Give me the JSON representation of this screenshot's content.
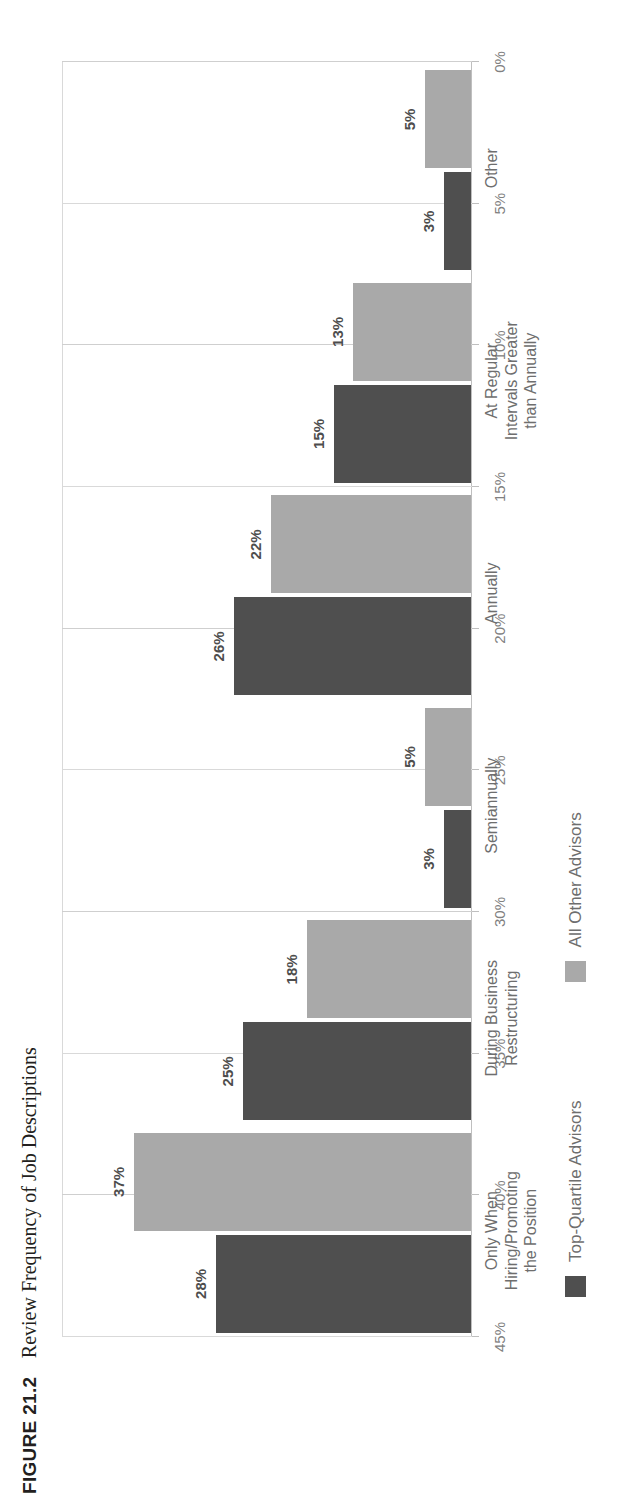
{
  "figure": {
    "label": "FIGURE 21.2",
    "title": "Review Frequency of Job Descriptions"
  },
  "colors": {
    "top_quartile": "#4f4f4f",
    "all_other": "#a9a9a9",
    "gridline": "#d9d9d9",
    "axis": "#bfbfbf",
    "tick_text": "#808080",
    "category_text": "#6e6e6e",
    "data_label_text": "#4d4d4d"
  },
  "chart_data": {
    "type": "bar",
    "title": "Review Frequency of Job Descriptions",
    "xlabel": "",
    "ylabel": "",
    "ylim": [
      0,
      45
    ],
    "grid": true,
    "orientation": "vertical",
    "legend_position": "bottom",
    "tick_labels": [
      "0%",
      "5%",
      "10%",
      "15%",
      "20%",
      "25%",
      "30%",
      "35%",
      "40%",
      "45%"
    ],
    "tick_values": [
      0,
      5,
      10,
      15,
      20,
      25,
      30,
      35,
      40,
      45
    ],
    "categories": [
      "Only When\nHiring/Promoting\nthe Position",
      "During Business\nRestructuring",
      "Semiannually",
      "Annually",
      "At Regular\nIntervals Greater\nthan Annually",
      "Other"
    ],
    "category_lines": [
      [
        "Only When",
        "Hiring/Promoting",
        "the Position"
      ],
      [
        "During Business",
        "Restructuring"
      ],
      [
        "Semiannually"
      ],
      [
        "Annually"
      ],
      [
        "At Regular",
        "Intervals Greater",
        "than Annually"
      ],
      [
        "Other"
      ]
    ],
    "series": [
      {
        "name": "Top-Quartile Advisors",
        "color": "#4f4f4f",
        "values": [
          28,
          25,
          3,
          26,
          15,
          3
        ],
        "labels": [
          "28%",
          "25%",
          "3%",
          "26%",
          "15%",
          "3%"
        ]
      },
      {
        "name": "All Other Advisors",
        "color": "#a9a9a9",
        "values": [
          37,
          18,
          5,
          22,
          13,
          5
        ],
        "labels": [
          "37%",
          "18%",
          "5%",
          "22%",
          "13%",
          "5%"
        ]
      }
    ]
  },
  "legend": [
    {
      "label": "Top-Quartile Advisors",
      "swatch": "dark"
    },
    {
      "label": "All Other Advisors",
      "swatch": "light"
    }
  ]
}
